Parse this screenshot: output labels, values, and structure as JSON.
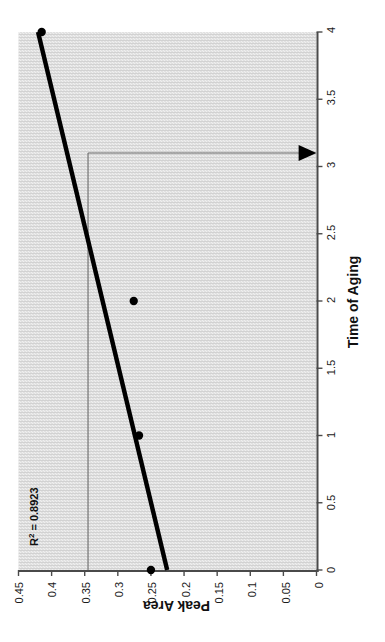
{
  "chart_data": {
    "type": "scatter",
    "title": "",
    "xlabel": "Time of Aging",
    "ylabel": "Peak Area",
    "xlim": [
      0,
      4
    ],
    "ylim": [
      0,
      0.45
    ],
    "xticks": [
      "0",
      "0.5",
      "1",
      "1.5",
      "2",
      "2.5",
      "3",
      "3.5",
      "4"
    ],
    "xtick_values": [
      0,
      0.5,
      1,
      1.5,
      2,
      2.5,
      3,
      3.5,
      4
    ],
    "yticks": [
      "0",
      "0.05",
      "0.1",
      "0.15",
      "0.2",
      "0.25",
      "0.3",
      "0.35",
      "0.4",
      "0.45"
    ],
    "ytick_values": [
      0,
      0.05,
      0.1,
      0.15,
      0.2,
      0.25,
      0.3,
      0.35,
      0.4,
      0.45
    ],
    "grid": false,
    "legend": "none",
    "plot_background": "#e0e0e0",
    "marker_color": "#000000",
    "trendline_color": "#000000",
    "series": [
      {
        "name": "Peak Area vs Time of Aging",
        "x": [
          0,
          1,
          2,
          4
        ],
        "y": [
          0.25,
          0.268,
          0.276,
          0.415
        ]
      }
    ],
    "trendline": {
      "type": "linear",
      "x": [
        0,
        4
      ],
      "y": [
        0.2255,
        0.4205
      ]
    },
    "annotations": [
      {
        "name": "r-squared",
        "text": "R2 = 0.8923",
        "r_symbol": "R",
        "superscript": "2",
        "equation_rest": " = 0.8923",
        "value": 0.8923
      },
      {
        "name": "reference-lines",
        "horizontal_y": 0.345,
        "vertical_x": 3.1,
        "arrow": "down"
      }
    ]
  },
  "chart": {
    "axis_title_x": "Time of Aging",
    "axis_title_y": "Peak Area",
    "r2_prefix": "R",
    "r2_sup": "2",
    "r2_value": " = 0.8923"
  }
}
